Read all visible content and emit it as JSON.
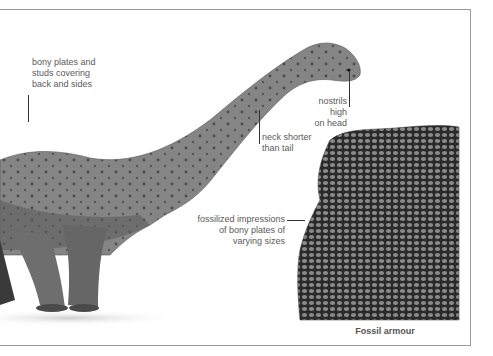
{
  "annotations": [
    {
      "id": "bony-plates",
      "lines": [
        "bony plates and",
        "studs covering",
        "back and sides"
      ]
    },
    {
      "id": "nostrils",
      "lines": [
        "nostrils high",
        "on head"
      ]
    },
    {
      "id": "neck",
      "lines": [
        "neck shorter",
        "than tail"
      ]
    },
    {
      "id": "fossil-impressions",
      "lines": [
        "fossilized impressions",
        "of bony plates of",
        "varying sizes"
      ]
    }
  ],
  "fossil_panel": {
    "caption": "Fossil armour"
  },
  "illustration": {
    "subject": "sauropod dinosaur with armoured skin",
    "palette": {
      "skin": "#7a7a7a",
      "shadow": "#3a3a3a",
      "frame": "#9a9a9a"
    }
  }
}
